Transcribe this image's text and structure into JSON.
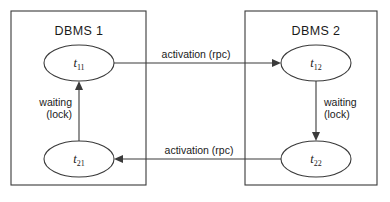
{
  "figure": {
    "background_color": "#ffffff",
    "stroke_color": "#3a3a3a",
    "text_color": "#1a1a1a",
    "width": 390,
    "height": 202
  },
  "boxes": [
    {
      "id": "dbms-1",
      "label": "DBMS 1",
      "x": 11,
      "y": 11,
      "width": 135,
      "height": 174,
      "label_x": 79,
      "label_y": 35
    },
    {
      "id": "dbms-2",
      "label": "DBMS 2",
      "x": 245,
      "y": 11,
      "width": 132,
      "height": 174,
      "label_x": 316,
      "label_y": 35
    }
  ],
  "nodes": [
    {
      "id": "t11",
      "base": "t",
      "subscript": "11",
      "cx": 79,
      "cy": 63,
      "rx": 35,
      "ry": 18
    },
    {
      "id": "t12",
      "base": "t",
      "subscript": "12",
      "cx": 316,
      "cy": 63,
      "rx": 35,
      "ry": 18
    },
    {
      "id": "t21",
      "base": "t",
      "subscript": "21",
      "cx": 79,
      "cy": 159,
      "rx": 35,
      "ry": 18
    },
    {
      "id": "t22",
      "base": "t",
      "subscript": "22",
      "cx": 316,
      "cy": 159,
      "rx": 35,
      "ry": 18
    }
  ],
  "edges": [
    {
      "id": "edge-t11-to-t12",
      "label": "activation (rpc)",
      "from": "t11",
      "to": "t12",
      "path": "M 114 63 L 277 63",
      "arrow": "M 281 63 L 272 59 L 272 67 Z",
      "label_x": 196,
      "label_y": 58,
      "label_anchor": "middle"
    },
    {
      "id": "edge-t11-waiting-lock",
      "label_line_1": "waiting",
      "label_line_2": "(lock)",
      "from": "t21",
      "to": "t11",
      "path": "M 79 141 L 79 86",
      "arrow": "M 79 81 L 75 90 L 83 90 Z",
      "label_x": 72,
      "label_y": 106,
      "label_anchor": "end"
    },
    {
      "id": "edge-t12-waiting-lock",
      "label_line_1": "waiting",
      "label_line_2": "(lock)",
      "from": "t12",
      "to": "t22",
      "path": "M 316 81 L 316 136",
      "arrow": "M 316 141 L 312 132 L 320 132 Z",
      "label_x": 324,
      "label_y": 106,
      "label_anchor": "start"
    },
    {
      "id": "edge-t22-to-t21",
      "label": "activation (rpc)",
      "from": "t22",
      "to": "t21",
      "path": "M 281 159 L 118 159",
      "arrow": "M 114 159 L 123 155 L 123 163 Z",
      "label_x": 199,
      "label_y": 154,
      "label_anchor": "middle"
    }
  ]
}
